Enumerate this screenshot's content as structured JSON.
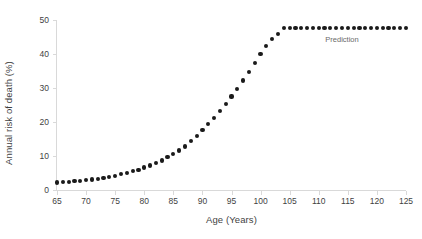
{
  "chart_data": {
    "type": "scatter",
    "title": "",
    "xlabel": "Age (Years)",
    "ylabel": "Annual risk of death (%)",
    "xlim": [
      65,
      125
    ],
    "ylim": [
      0,
      50
    ],
    "xticks": [
      65,
      70,
      75,
      80,
      85,
      90,
      95,
      100,
      105,
      110,
      115,
      120,
      125
    ],
    "yticks": [
      0,
      10,
      20,
      30,
      40,
      50
    ],
    "grid": false,
    "legend": null,
    "marker_color": "#1a1a1a",
    "axis_color": "#d9d9d9",
    "annotations": [
      {
        "text": "Prediction",
        "x": 114,
        "y": 44.0
      }
    ],
    "series": [
      {
        "name": "Annual risk of death",
        "x": [
          65,
          66,
          67,
          68,
          69,
          70,
          71,
          72,
          73,
          74,
          75,
          76,
          77,
          78,
          79,
          80,
          81,
          82,
          83,
          84,
          85,
          86,
          87,
          88,
          89,
          90,
          91,
          92,
          93,
          94,
          95,
          96,
          97,
          98,
          99,
          100,
          101,
          102,
          103,
          104,
          105,
          106,
          107,
          108,
          109,
          110,
          111,
          112,
          113,
          114,
          115,
          116,
          117,
          118,
          119,
          120,
          121,
          122,
          123,
          124,
          125
        ],
        "values": [
          2.2,
          2.3,
          2.4,
          2.6,
          2.7,
          2.9,
          3.1,
          3.3,
          3.6,
          3.9,
          4.2,
          4.6,
          5.0,
          5.5,
          6.0,
          6.6,
          7.2,
          7.9,
          8.7,
          9.6,
          10.5,
          11.6,
          12.8,
          14.5,
          16.0,
          17.6,
          19.3,
          21.2,
          23.2,
          25.3,
          27.5,
          29.8,
          32.2,
          34.7,
          37.3,
          40.0,
          42.4,
          44.3,
          46.0,
          47.6,
          47.6,
          47.6,
          47.6,
          47.6,
          47.6,
          47.6,
          47.6,
          47.6,
          47.6,
          47.6,
          47.6,
          47.6,
          47.6,
          47.6,
          47.6,
          47.6,
          47.6,
          47.6,
          47.6,
          47.6,
          47.6
        ]
      }
    ]
  }
}
